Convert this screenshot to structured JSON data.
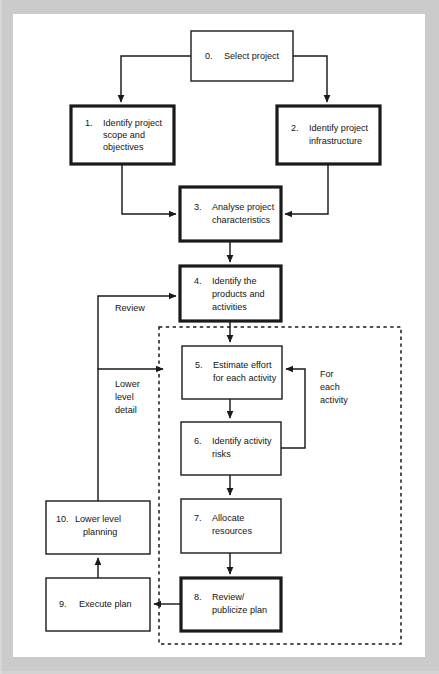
{
  "diagram": {
    "colors": {
      "page_border": "#cfcfcf",
      "canvas": "#ffffff",
      "stroke": "#1a1a1a",
      "text": "#141414"
    },
    "boxes": [
      {
        "id": "box0",
        "num": "0.",
        "lines": [
          "Select project"
        ],
        "emphasis": "normal",
        "x": 178,
        "y": 17,
        "w": 102,
        "h": 50
      },
      {
        "id": "box1",
        "num": "1.",
        "lines": [
          "Identify project",
          "scope and",
          "objectives"
        ],
        "emphasis": "bold",
        "x": 58,
        "y": 92,
        "w": 103,
        "h": 58
      },
      {
        "id": "box2",
        "num": "2.",
        "lines": [
          "Identify project",
          "infrastructure"
        ],
        "emphasis": "bold",
        "x": 264,
        "y": 92,
        "w": 103,
        "h": 58
      },
      {
        "id": "box3",
        "num": "3.",
        "lines": [
          "Analyse project",
          "characteristics"
        ],
        "emphasis": "bold",
        "x": 167,
        "y": 173,
        "w": 101,
        "h": 54
      },
      {
        "id": "box4",
        "num": "4.",
        "lines": [
          "Identify the",
          "products and",
          "activities"
        ],
        "emphasis": "bold",
        "x": 167,
        "y": 252,
        "w": 101,
        "h": 55
      },
      {
        "id": "box5",
        "num": "5.",
        "lines": [
          "Estimate effort",
          "for each activity"
        ],
        "emphasis": "normal",
        "x": 169,
        "y": 332,
        "w": 100,
        "h": 53
      },
      {
        "id": "box6",
        "num": "6.",
        "lines": [
          "Identify activity",
          "risks"
        ],
        "emphasis": "normal",
        "x": 168,
        "y": 408,
        "w": 100,
        "h": 53
      },
      {
        "id": "box7",
        "num": "7.",
        "lines": [
          "Allocate",
          "resources"
        ],
        "emphasis": "normal",
        "x": 168,
        "y": 485,
        "w": 100,
        "h": 54
      },
      {
        "id": "box8",
        "num": "8.",
        "lines": [
          "Review/",
          "publicize plan"
        ],
        "emphasis": "bold",
        "x": 168,
        "y": 564,
        "w": 100,
        "h": 53
      },
      {
        "id": "box9",
        "num": "9.",
        "lines": [
          "Execute plan"
        ],
        "emphasis": "normal",
        "x": 33,
        "y": 564,
        "w": 104,
        "h": 53
      },
      {
        "id": "box10",
        "num": "10.",
        "lines": [
          "Lower level",
          "planning"
        ],
        "emphasis": "normal",
        "x": 33,
        "y": 487,
        "w": 104,
        "h": 53
      }
    ],
    "annotations": [
      {
        "id": "annot-review",
        "lines": [
          "Review"
        ],
        "x": 102,
        "y": 292
      },
      {
        "id": "annot-lower-detail",
        "lines": [
          "Lower",
          "level",
          "detail"
        ],
        "x": 102,
        "y": 367
      },
      {
        "id": "annot-for-each",
        "lines": [
          "For",
          "each",
          "activity"
        ],
        "x": 307,
        "y": 367
      }
    ],
    "dashed_group": {
      "label": "for-each-activity-loop-boundary",
      "x": 146,
      "y": 313,
      "w": 242,
      "h": 317
    },
    "edges": [
      {
        "id": "edge-0-to-1",
        "from": "box0",
        "to": "box1",
        "label": ""
      },
      {
        "id": "edge-0-to-2",
        "from": "box0",
        "to": "box2",
        "label": ""
      },
      {
        "id": "edge-1-to-3",
        "from": "box1",
        "to": "box3",
        "label": ""
      },
      {
        "id": "edge-2-to-3",
        "from": "box2",
        "to": "box3",
        "label": ""
      },
      {
        "id": "edge-3-to-4",
        "from": "box3",
        "to": "box4",
        "label": ""
      },
      {
        "id": "edge-4-to-5",
        "from": "box4",
        "to": "box5",
        "label": ""
      },
      {
        "id": "edge-5-to-6",
        "from": "box5",
        "to": "box6",
        "label": ""
      },
      {
        "id": "edge-6-to-5",
        "from": "box6",
        "to": "box5",
        "label": "For each activity"
      },
      {
        "id": "edge-6-to-7",
        "from": "box6",
        "to": "box7",
        "label": ""
      },
      {
        "id": "edge-7-to-8",
        "from": "box7",
        "to": "box8",
        "label": ""
      },
      {
        "id": "edge-8-to-9",
        "from": "box8",
        "to": "box9",
        "label": ""
      },
      {
        "id": "edge-9-to-10",
        "from": "box9",
        "to": "box10",
        "label": ""
      },
      {
        "id": "edge-10-to-5",
        "from": "box10",
        "to": "box5",
        "label": "Lower level detail"
      },
      {
        "id": "edge-10-to-4",
        "from": "box10",
        "to": "box4",
        "label": "Review"
      }
    ]
  }
}
